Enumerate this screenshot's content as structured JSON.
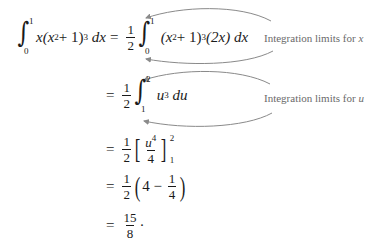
{
  "equation": {
    "line1": {
      "lhs": {
        "integral_lower": "0",
        "integral_upper": "1",
        "integrand_prefix": "x",
        "inner": "(x",
        "inner_exp": "2",
        "inner_tail": " + 1)",
        "outer_exp": "3",
        "differential": "dx"
      },
      "equals": "=",
      "coef_num": "1",
      "coef_den": "2",
      "rhs": {
        "integral_lower": "0",
        "integral_upper": "1",
        "inner": "(x",
        "inner_exp": "2",
        "inner_tail": " + 1)",
        "outer_exp": "3",
        "factor": "(2x)",
        "differential": "dx"
      },
      "annotation": {
        "text": "Integration limits for ",
        "variable": "x"
      }
    },
    "line2": {
      "equals": "=",
      "coef_num": "1",
      "coef_den": "2",
      "integral_lower": "1",
      "integral_upper": "2",
      "base": "u",
      "exp": "3",
      "differential": "du",
      "annotation": {
        "text": "Integration limits for ",
        "variable": "u"
      }
    },
    "line3": {
      "equals": "=",
      "coef_num": "1",
      "coef_den": "2",
      "frac_num_base": "u",
      "frac_num_exp": "4",
      "frac_den": "4",
      "upper": "2",
      "lower": "1"
    },
    "line4": {
      "equals": "=",
      "coef_num": "1",
      "coef_den": "2",
      "first": "4",
      "minus": "−",
      "frac_num": "1",
      "frac_den": "4"
    },
    "line5": {
      "equals": "=",
      "num": "15",
      "den": "8",
      "trailing": "·"
    }
  },
  "colors": {
    "math_text": "#1a1a1a",
    "annotation_text": "#6a6a6a",
    "arrow": "#8a8a8a"
  }
}
